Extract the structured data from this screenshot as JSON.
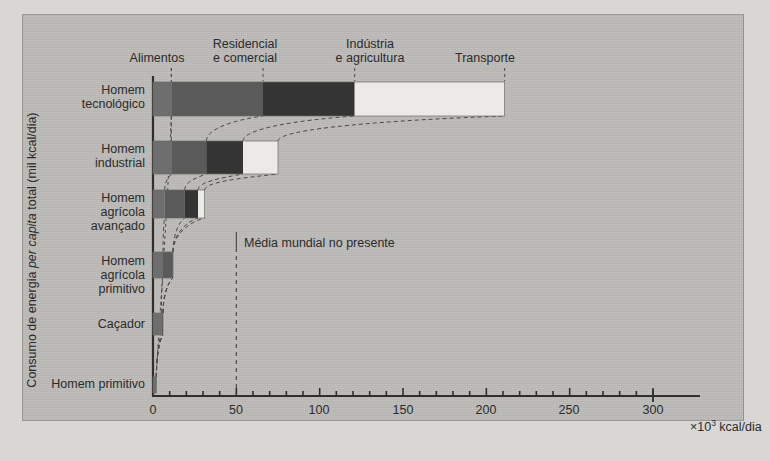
{
  "figure": {
    "y_axis_label": "Consumo de energia per capita total (mil kcal/dia)",
    "y_axis_label_pre": "Consumo de energia ",
    "y_axis_label_italic": "per capita",
    "y_axis_label_post": " total (mil kcal/dia)",
    "x_unit": "×10",
    "x_unit_sup": "3",
    "x_unit_tail": " kcal/dia",
    "annotation": "Média mundial no presente",
    "annotation_value": 50
  },
  "colors": {
    "panel_bg": "#bdbcb8",
    "page_bg": "#d9d7d3",
    "axis": "#2f2f2f",
    "text": "#2b2b2b",
    "alimentos": "#6e6e6e",
    "residencial": "#5a5a5a",
    "industria": "#343434",
    "transporte": "#eceae6",
    "dashed": "#4a4a4a"
  },
  "chart_data": {
    "type": "bar",
    "orientation": "horizontal",
    "stacked": true,
    "title": "",
    "xlabel": "×10³ kcal/dia",
    "ylabel": "Consumo de energia per capita total (mil kcal/dia)",
    "xlim": [
      0,
      300
    ],
    "xticks": [
      0,
      50,
      100,
      150,
      200,
      250,
      300
    ],
    "xtick_labels": [
      "0",
      "50",
      "100",
      "150",
      "200",
      "250",
      "300"
    ],
    "minor_tick_step": 10,
    "grid": false,
    "legend_position": "top",
    "categories": [
      "Homem tecnológico",
      "Homem industrial",
      "Homem agrícola avançado",
      "Homem agrícola primitivo",
      "Caçador",
      "Homem primitivo"
    ],
    "category_lines": [
      [
        "Homem",
        "tecnológico"
      ],
      [
        "Homem",
        "industrial"
      ],
      [
        "Homem",
        "agrícola",
        "avançado"
      ],
      [
        "Homem",
        "agrícola",
        "primitivo"
      ],
      [
        "Caçador"
      ],
      [
        "Homem primitivo"
      ]
    ],
    "series": [
      {
        "name": "Alimentos",
        "key": "alimentos",
        "color": "#6e6e6e",
        "values": [
          11,
          11,
          7,
          6,
          5,
          2
        ]
      },
      {
        "name": "Residencial e comercial",
        "key": "residencial",
        "color": "#5a5a5a",
        "values": [
          55,
          21,
          12,
          6,
          1,
          0
        ]
      },
      {
        "name": "Indústria e agricultura",
        "key": "industria",
        "color": "#343434",
        "values": [
          55,
          22,
          8,
          0,
          0,
          0
        ]
      },
      {
        "name": "Transporte",
        "key": "transporte",
        "color": "#eceae6",
        "values": [
          90,
          21,
          4,
          0,
          0,
          0
        ]
      }
    ],
    "totals": [
      211,
      75,
      31,
      12,
      6,
      2
    ],
    "annotations": [
      {
        "text": "Média mundial no presente",
        "x": 50,
        "type": "vertical-dashed-line"
      }
    ],
    "legend_entries": [
      {
        "label": "Alimentos",
        "lines": [
          "Alimentos"
        ]
      },
      {
        "label": "Residencial e comercial",
        "lines": [
          "Residencial",
          "e comercial"
        ]
      },
      {
        "label": "Indústria e agricultura",
        "lines": [
          "Indústria",
          "e agricultura"
        ]
      },
      {
        "label": "Transporte",
        "lines": [
          "Transporte"
        ]
      }
    ]
  }
}
